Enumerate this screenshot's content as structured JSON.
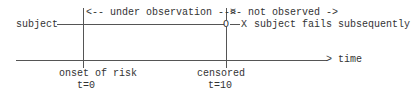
{
  "diagram": {
    "subject_label": "subject",
    "observation_label": "|<-- under observation -->|",
    "not_observed_label": "<- not observed ->",
    "censor_marker": "O",
    "failure_marker": "X",
    "failure_text": "subject fails subsequently",
    "time_arrow": ">",
    "time_label": "time",
    "onset_label": "onset of risk",
    "onset_time": "t=0",
    "censored_label": "censored",
    "censored_time": "t=10"
  }
}
